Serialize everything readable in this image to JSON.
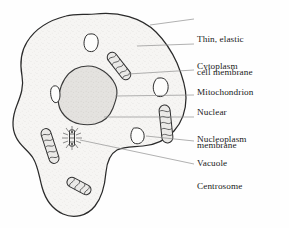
{
  "diagram": {
    "background_color": "#fefefe",
    "ink_color": "#1a1a1a",
    "cytoplasm_fill": "#f5f4f2",
    "nucleus_fill": "#e2e0dd",
    "leader_line_color": "#8c8c8c",
    "labels": [
      {
        "id": "cell-membrane",
        "line1": "Thin, elastic",
        "line2": "cell membrane",
        "x": 197,
        "y": 12
      },
      {
        "id": "cytoplasm",
        "line1": "Cytoplasm",
        "line2": "",
        "x": 197,
        "y": 40
      },
      {
        "id": "mitochondrion",
        "line1": "Mitochondrion",
        "line2": "",
        "x": 197,
        "y": 66
      },
      {
        "id": "nuclear-membrane",
        "line1": "Nuclear",
        "line2": "membrane",
        "x": 197,
        "y": 86
      },
      {
        "id": "nucleoplasm",
        "line1": "Nucleoplasm",
        "line2": "",
        "x": 197,
        "y": 113
      },
      {
        "id": "vacuole",
        "line1": "Vacuole",
        "line2": "",
        "x": 197,
        "y": 137
      },
      {
        "id": "centrosome",
        "line1": "Centrosome",
        "line2": "",
        "x": 197,
        "y": 160
      }
    ],
    "organelles": {
      "nucleus": {
        "name": "nucleus",
        "cx": 88,
        "cy": 96
      },
      "mitochondria_count": 4,
      "vacuoles_count": 4,
      "centrosome": {
        "cx": 72,
        "cy": 137
      }
    }
  }
}
